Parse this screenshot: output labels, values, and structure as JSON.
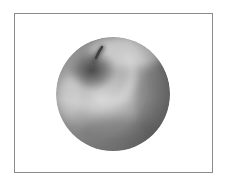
{
  "figure": {
    "subject": "apple",
    "style": "grayscale shaded sphere illustration",
    "caption": "Grayscale shaded apple with stem",
    "frame_color": "#8a8a8a",
    "background_color": "#ffffff"
  },
  "apple": {
    "center_x": 113,
    "center_y": 94,
    "radius": 57,
    "tones": {
      "highlight": "#e8e8e8",
      "midtone": "#a8a8a8",
      "shadow": "#5a5a5a",
      "deep_shadow": "#3c3c3c"
    },
    "stem_color": "#4a4a4a"
  }
}
